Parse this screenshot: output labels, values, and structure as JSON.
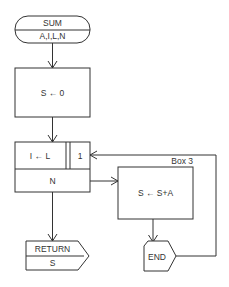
{
  "flowchart": {
    "start": {
      "name": "SUM",
      "params": "A,I,L,N"
    },
    "init": {
      "label": "S ← 0"
    },
    "loop": {
      "assign": "I ← L",
      "step": "1",
      "limit": "N"
    },
    "body": {
      "box_label": "Box 3",
      "label": "S ← S+A"
    },
    "loop_end": {
      "label": "END"
    },
    "return": {
      "keyword": "RETURN",
      "value": "S"
    }
  }
}
